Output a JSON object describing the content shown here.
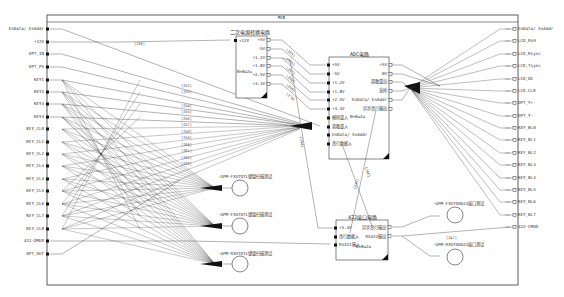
{
  "sheet": {
    "title": "MCB"
  },
  "left_ports": [
    {
      "label": "EnData/ EnAddr",
      "y": 29
    },
    {
      "label": "+12V",
      "y": 42
    },
    {
      "label": "OPT_IN",
      "y": 54
    },
    {
      "label": "OPT_PS",
      "y": 67
    },
    {
      "label": "KEY1",
      "y": 80
    },
    {
      "label": "KEY2",
      "y": 92
    },
    {
      "label": "KEY3",
      "y": 104
    },
    {
      "label": "KEY4",
      "y": 117
    },
    {
      "label": "KEY_CL0",
      "y": 129
    },
    {
      "label": "KEY_CL1",
      "y": 142
    },
    {
      "label": "KEY_CL2",
      "y": 154
    },
    {
      "label": "KEY_CL3",
      "y": 166
    },
    {
      "label": "KEY_CL4",
      "y": 179
    },
    {
      "label": "KEY_CL5",
      "y": 191
    },
    {
      "label": "KEY_CL6",
      "y": 204
    },
    {
      "label": "KEY_CL7",
      "y": 216
    },
    {
      "label": "KEY_CL8",
      "y": 229
    },
    {
      "label": "422-DMUX",
      "y": 241
    },
    {
      "label": "OPT_OUT",
      "y": 254
    }
  ],
  "right_ports": [
    {
      "label": "EnData/ EnAddr",
      "y": 29
    },
    {
      "label": "LCD_RsH",
      "y": 41
    },
    {
      "label": "LCD_Rsync",
      "y": 54
    },
    {
      "label": "LCD_Tsync",
      "y": 66
    },
    {
      "label": "LCD_DE",
      "y": 79
    },
    {
      "label": "LCD_CLK",
      "y": 91
    },
    {
      "label": "OPT_Y+",
      "y": 103
    },
    {
      "label": "OPT_Y-",
      "y": 116
    },
    {
      "label": "KEY_BL0",
      "y": 128
    },
    {
      "label": "KEY_BL1",
      "y": 140
    },
    {
      "label": "KEY_BL2",
      "y": 153
    },
    {
      "label": "KEY_BL3",
      "y": 165
    },
    {
      "label": "KEY_BL4",
      "y": 178
    },
    {
      "label": "KEY_BL5",
      "y": 190
    },
    {
      "label": "KEY_BL6",
      "y": 202
    },
    {
      "label": "KEY_BL7",
      "y": 215
    },
    {
      "label": "422-CMDD",
      "y": 227
    }
  ],
  "blocks": {
    "power_convert": {
      "title": "二次电源转换电路",
      "inputs": [
        "+12V"
      ],
      "outputs": [
        "+5V",
        "-5V",
        "+1.2V",
        "+1.8V",
        "+2.5V",
        "+3.3V"
      ],
      "note": "N=8u2u"
    },
    "adc": {
      "title": "ADC电路",
      "inputs": [
        "+5V",
        "-5V",
        "+1.2V",
        "+1.8V",
        "+2.5V",
        "+3.3V",
        "模拟量入",
        "离散量入",
        "EnData/ EnAddr",
        "串行数据入"
      ],
      "outputs": [
        "+5V",
        "0V",
        "离散量出",
        "采样",
        "EnData/ EnAddr",
        "异步串行输出"
      ],
      "note": "N=8u2u"
    },
    "rs422": {
      "title": "422接口电路",
      "inputs": [
        "+3.3V",
        "串行数据入",
        "RS422输入"
      ],
      "outputs": [
        "异步串行输出",
        "RS422输出"
      ],
      "note": "N=8u2u"
    }
  },
  "test_points": [
    {
      "label": "-GPM-FXUTDTL键盘扫描测试"
    },
    {
      "label": "-GPM-FXUTDTL键盘扫描测试"
    },
    {
      "label": "-GPM-RXUTDTL键盘扫描测试"
    },
    {
      "label": "-GPM-FXUTDOA22接口测试"
    },
    {
      "label": "-GPM-RXUTDOA22接口测试"
    }
  ],
  "net_tags": {
    "plus12v": "[236]",
    "adc_bus": [
      "[265]",
      "[266]",
      "[267]",
      "[268]",
      "[269]",
      "[270]"
    ],
    "mid_bus": [
      "[252]",
      "[253]",
      "[254]",
      "[255]",
      "[256]",
      "[257]",
      "[258]",
      "[259]",
      "[260]",
      "[261]",
      "[262]",
      "[263]"
    ],
    "rs422_out": "[247]",
    "vert_1": "[244]",
    "vert_2": "[245]",
    "vert_3": "[246]"
  },
  "colors": {
    "line": "#222222",
    "frame": "#333333",
    "background": "#ffffff"
  }
}
